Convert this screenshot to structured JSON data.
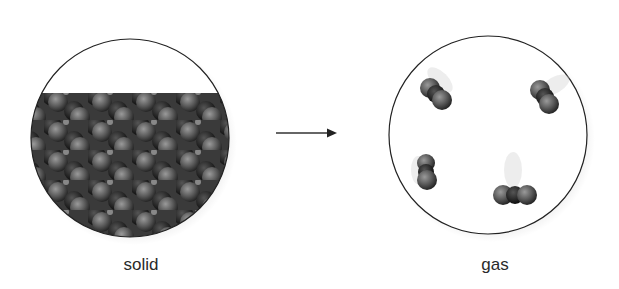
{
  "diagram": {
    "left_panel": {
      "label": "solid",
      "description": "tightly packed diatomic molecules in a lattice"
    },
    "arrow": {
      "direction": "right"
    },
    "right_panel": {
      "label": "gas",
      "molecule_count": 4,
      "description": "few diatomic molecules spread apart, moving"
    }
  },
  "colors": {
    "sphere": "#6b6b6b",
    "sphere_dark": "#1e1e1e",
    "outline": "#222222",
    "text": "#2a2a2a"
  }
}
